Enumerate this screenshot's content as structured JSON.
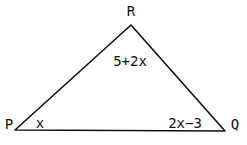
{
  "diagram": {
    "type": "triangle",
    "stroke_color": "#111111",
    "vertices": {
      "R": {
        "label": "R",
        "x": 131,
        "y": 25
      },
      "P": {
        "label": "P",
        "x": 15,
        "y": 130
      },
      "Q": {
        "label": "Q",
        "x": 225,
        "y": 131
      }
    },
    "angles": {
      "R": "5+2x",
      "P": "x",
      "Q": "2x−3"
    }
  }
}
